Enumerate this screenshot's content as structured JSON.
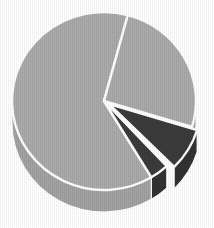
{
  "chart_data": {
    "type": "pie",
    "title": "",
    "subtitle": "",
    "xlabel": "",
    "ylabel": "",
    "grid": false,
    "legend_position": "none",
    "three_d": true,
    "depth_px": 22,
    "start_angle_deg": 285,
    "direction": "clockwise",
    "categories": [
      "Slice 1",
      "Slice 2",
      "Slice 3",
      "Slice 4"
    ],
    "values": [
      69,
      17,
      9,
      5
    ],
    "labels": [],
    "annotations": [],
    "slices": [
      {
        "name": "Slice 1",
        "value": 69,
        "percent": 69,
        "color": "#aaaaaa",
        "side_color": "#a2a2a2",
        "start_deg": 59,
        "end_deg": 285,
        "exploded": false,
        "explode_px": 0
      },
      {
        "name": "Slice 2",
        "value": 17,
        "percent": 17,
        "color": "#aaaaaa",
        "side_color": "#a2a2a2",
        "start_deg": 285,
        "end_deg": 17,
        "exploded": false,
        "explode_px": 0
      },
      {
        "name": "Slice 3",
        "value": 9,
        "percent": 9,
        "color": "#3b3b3b",
        "side_color": "#323232",
        "start_deg": 17,
        "end_deg": 45,
        "exploded": true,
        "explode_px": 6
      },
      {
        "name": "Slice 4",
        "value": 5,
        "percent": 5,
        "color": "#3b3b3b",
        "side_color": "#323232",
        "start_deg": 47,
        "end_deg": 59,
        "exploded": false,
        "explode_px": 0
      }
    ],
    "geometry": {
      "center_x": 104,
      "center_y": 101,
      "radius_x": 92,
      "radius_y": 89,
      "separator_color": "#ffffff",
      "separator_width": 2.4,
      "background": "#ffffff"
    },
    "colors": {
      "light_gray": "#aaaaaa",
      "dark_gray": "#3b3b3b",
      "side_wall": "#a2a2a2",
      "separator": "#ffffff",
      "background": "#ffffff"
    }
  }
}
